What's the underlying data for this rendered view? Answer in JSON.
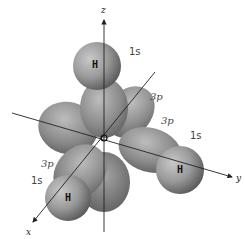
{
  "diagram": {
    "title": "",
    "axes": {
      "x": {
        "label": "x"
      },
      "y": {
        "label": "y"
      },
      "z": {
        "label": "z"
      }
    },
    "central_atom": {
      "label": ""
    },
    "hydrogens": [
      {
        "id": "h-top",
        "atom_label": "H",
        "orbital_label": "1s",
        "axis": "z"
      },
      {
        "id": "h-right",
        "atom_label": "H",
        "orbital_label": "1s",
        "axis": "y"
      },
      {
        "id": "h-bottom-left",
        "atom_label": "H",
        "orbital_label": "1s",
        "axis": "x"
      }
    ],
    "p_orbital_labels": [
      {
        "axis": "z",
        "label": "3p"
      },
      {
        "axis": "y",
        "label": "3p"
      },
      {
        "axis": "x",
        "label": "3p"
      }
    ],
    "colors": {
      "background": "#ffffff",
      "lobe_light": "#b8b8b8",
      "lobe_mid": "#8e8e8e",
      "lobe_dark": "#5e5e5e",
      "axis": "#222222",
      "text": "#444444"
    }
  }
}
